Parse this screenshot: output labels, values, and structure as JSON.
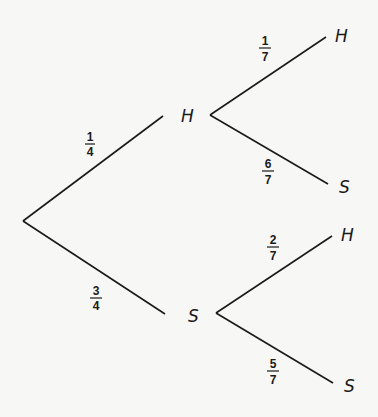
{
  "tree": {
    "root": {
      "x": 23,
      "y": 221
    },
    "level1": [
      {
        "id": "H1",
        "label": "H",
        "prob_num": "1",
        "prob_den": "4",
        "end": {
          "x": 163,
          "y": 116
        },
        "label_pos": {
          "x": 183,
          "y": 122
        },
        "frac_pos": {
          "x": 90,
          "y": 145
        }
      },
      {
        "id": "S1",
        "label": "S",
        "prob_num": "3",
        "prob_den": "4",
        "end": {
          "x": 165,
          "y": 314
        },
        "label_pos": {
          "x": 189,
          "y": 321
        },
        "frac_pos": {
          "x": 95,
          "y": 300
        }
      }
    ],
    "level2": [
      {
        "parent": "H1",
        "label": "H",
        "prob_num": "1",
        "prob_den": "7",
        "start": {
          "x": 210,
          "y": 115
        },
        "end": {
          "x": 326,
          "y": 37
        },
        "label_pos": {
          "x": 336,
          "y": 41
        },
        "frac_pos": {
          "x": 267,
          "y": 50
        }
      },
      {
        "parent": "H1",
        "label": "S",
        "prob_num": "6",
        "prob_den": "7",
        "start": {
          "x": 210,
          "y": 115
        },
        "end": {
          "x": 328,
          "y": 184
        },
        "label_pos": {
          "x": 339,
          "y": 192
        },
        "frac_pos": {
          "x": 268,
          "y": 172
        }
      },
      {
        "parent": "S1",
        "label": "H",
        "prob_num": "2",
        "prob_den": "7",
        "start": {
          "x": 216,
          "y": 313
        },
        "end": {
          "x": 332,
          "y": 236
        },
        "label_pos": {
          "x": 341,
          "y": 240
        },
        "frac_pos": {
          "x": 273,
          "y": 248
        }
      },
      {
        "parent": "S1",
        "label": "S",
        "prob_num": "5",
        "prob_den": "7",
        "start": {
          "x": 216,
          "y": 313
        },
        "end": {
          "x": 333,
          "y": 383
        },
        "label_pos": {
          "x": 344,
          "y": 391
        },
        "frac_pos": {
          "x": 273,
          "y": 372
        }
      }
    ]
  },
  "labels": {
    "n1_top": "H",
    "n1_bot": "S",
    "n2_hh": "H",
    "n2_hs": "S",
    "n2_sh": "H",
    "n2_ss": "S",
    "p_1_4_num": "1",
    "p_1_4_den": "4",
    "p_3_4_num": "3",
    "p_3_4_den": "4",
    "p_1_7_num": "1",
    "p_1_7_den": "7",
    "p_6_7_num": "6",
    "p_6_7_den": "7",
    "p_2_7_num": "2",
    "p_2_7_den": "7",
    "p_5_7_num": "5",
    "p_5_7_den": "7"
  }
}
